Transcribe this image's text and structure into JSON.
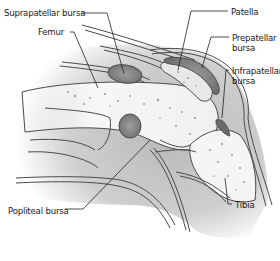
{
  "diagram": {
    "labels": [
      {
        "id": "suprapatellar-bursa",
        "text": "Suprapatellar bursa",
        "x": 4,
        "y": 8
      },
      {
        "id": "femur",
        "text": "Femur",
        "x": 38,
        "y": 27
      },
      {
        "id": "patella",
        "text": "Patella",
        "x": 231,
        "y": 7
      },
      {
        "id": "prepatellar-bursa",
        "line1": "Prepatellar",
        "line2": "bursa",
        "x": 232,
        "y": 33
      },
      {
        "id": "infrapatellar-bursa",
        "line1": "Infrapatellar",
        "line2": "bursa",
        "x": 232,
        "y": 66
      },
      {
        "id": "popliteal-bursa",
        "text": "Popliteal bursa",
        "x": 8,
        "y": 206
      },
      {
        "id": "tibia",
        "text": "Tibia",
        "x": 235,
        "y": 200
      }
    ],
    "colors": {
      "background": "#ffffff",
      "tissue": "#c8c8c8",
      "tissue_light": "#dedede",
      "bone": "#f4f4f4",
      "bursa": "#8a8a8a",
      "outline": "#4a4a4a",
      "leader": "#222222"
    }
  }
}
